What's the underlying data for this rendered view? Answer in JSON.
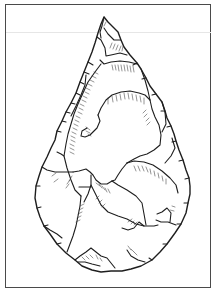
{
  "figure": {
    "colors": {
      "background": "#ffffff",
      "frame": "#4a4a4a",
      "ink": "#1e1e1e"
    }
  }
}
